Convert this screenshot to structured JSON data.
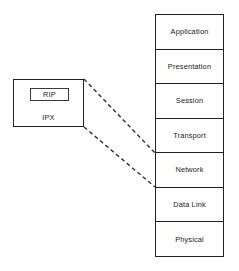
{
  "diagram": {
    "background_color": "#ffffff",
    "line_color": "#222222"
  },
  "protocol_box": {
    "name": "ipx-protocol-box",
    "outer_label": "IPX",
    "inner_box_label": "RIP"
  },
  "osi_model": {
    "name": "osi-reference-model",
    "layers": [
      {
        "number": 7,
        "label": "Application"
      },
      {
        "number": 6,
        "label": "Presentation"
      },
      {
        "number": 5,
        "label": "Session"
      },
      {
        "number": 4,
        "label": "Transport"
      },
      {
        "number": 3,
        "label": "Network"
      },
      {
        "number": 2,
        "label": "Data Link"
      },
      {
        "number": 1,
        "label": "Physical"
      }
    ]
  },
  "connectors": {
    "style": "dashed",
    "color": "#333333",
    "lines": [
      {
        "name": "upper-mapping-line",
        "from": [
          84,
          79
        ],
        "to": [
          155,
          153
        ]
      },
      {
        "name": "lower-mapping-line",
        "from": [
          84,
          127
        ],
        "to": [
          155,
          187
        ]
      }
    ]
  }
}
